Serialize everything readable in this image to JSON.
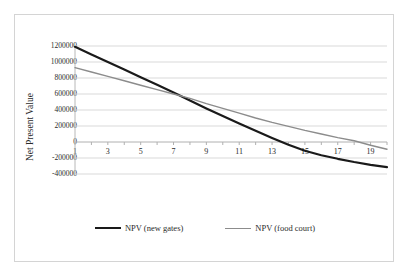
{
  "page": {
    "top_crop_artifact_text": "·            ·  ·            ·"
  },
  "chart_data": {
    "type": "line",
    "title": "",
    "xlabel": "",
    "ylabel": "Net Present Value",
    "xlim": [
      1,
      20
    ],
    "ylim": [
      -400000,
      1200000
    ],
    "grid": true,
    "legend_position": "bottom",
    "x_tick_labels": [
      "1",
      "3",
      "5",
      "7",
      "9",
      "11",
      "13",
      "15",
      "17",
      "19"
    ],
    "x_tick_values": [
      1,
      3,
      5,
      7,
      9,
      11,
      13,
      15,
      17,
      19
    ],
    "x_minor_ticks": [
      1,
      2,
      3,
      4,
      5,
      6,
      7,
      8,
      9,
      10,
      11,
      12,
      13,
      14,
      15,
      16,
      17,
      18,
      19,
      20
    ],
    "y_tick_labels": [
      "1200000",
      "1000000",
      "800000",
      "600000",
      "400000",
      "200000",
      "0",
      "-200000",
      "-400000"
    ],
    "y_tick_values": [
      1200000,
      1000000,
      800000,
      600000,
      400000,
      200000,
      0,
      -200000,
      -400000
    ],
    "x": [
      1,
      2,
      3,
      4,
      5,
      6,
      7,
      8,
      9,
      10,
      11,
      12,
      13,
      14,
      15,
      16,
      17,
      18,
      19,
      20
    ],
    "series": [
      {
        "name": "NPV (new gates)",
        "color": "#1a1a1a",
        "width": 2.2,
        "values": [
          1190000,
          1095000,
          1000000,
          905000,
          810000,
          715000,
          620000,
          520000,
          420000,
          325000,
          230000,
          140000,
          50000,
          -35000,
          -110000,
          -165000,
          -210000,
          -250000,
          -285000,
          -315000
        ]
      },
      {
        "name": "NPV (food court)",
        "color": "#8c8c8c",
        "width": 1.4,
        "values": [
          930000,
          875000,
          820000,
          765000,
          710000,
          655000,
          600000,
          545000,
          480000,
          420000,
          360000,
          300000,
          245000,
          195000,
          145000,
          100000,
          55000,
          15000,
          -40000,
          -90000
        ]
      }
    ]
  }
}
